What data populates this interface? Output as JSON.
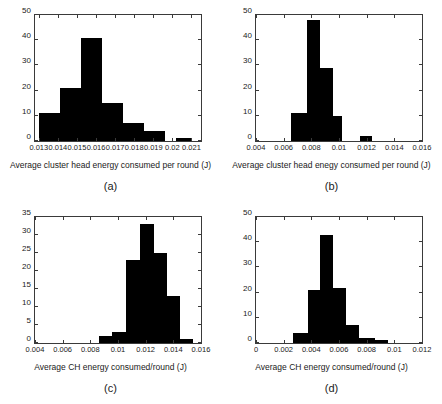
{
  "figure": {
    "background": "#ffffff",
    "bar_color": "#000000",
    "axis_color": "#3a3a3a"
  },
  "panels": [
    {
      "key": "a",
      "caption": "(a)",
      "xlabel": "Average cluster head energy consumed per round (J)",
      "ylabel": ""
    },
    {
      "key": "b",
      "caption": "(b)",
      "xlabel": "Average cluster head enegy consumed per round (J)",
      "ylabel": ""
    },
    {
      "key": "c",
      "caption": "(c)",
      "xlabel": "Average CH energy consumed/round (J)",
      "ylabel": ""
    },
    {
      "key": "d",
      "caption": "(d)",
      "xlabel": "Average CH energy consumed/round (J)",
      "ylabel": ""
    }
  ],
  "chart_data": [
    {
      "type": "bar",
      "panel": "a",
      "title": "",
      "xlabel": "Average cluster head energy consumed per round (J)",
      "ylabel": "",
      "xlim": [
        0.0128,
        0.0215
      ],
      "ylim": [
        0,
        50
      ],
      "xticks": [
        0.013,
        0.014,
        0.015,
        0.016,
        0.017,
        0.018,
        0.019,
        0.02,
        0.021
      ],
      "xtick_labels": [
        "0.013",
        "0.014",
        "0.015",
        "0.016",
        "0.017",
        "0.018",
        "0.019",
        "0.02",
        "0.021"
      ],
      "yticks": [
        0,
        10,
        20,
        30,
        40,
        50
      ],
      "ytick_labels": [
        "0",
        "10",
        "20",
        "30",
        "40",
        "50"
      ],
      "grid": false,
      "legend": null,
      "bins": [
        {
          "left": 0.013,
          "right": 0.0141,
          "value": 11
        },
        {
          "left": 0.0141,
          "right": 0.0152,
          "value": 21
        },
        {
          "left": 0.0152,
          "right": 0.0163,
          "value": 41
        },
        {
          "left": 0.0163,
          "right": 0.0174,
          "value": 15
        },
        {
          "left": 0.0174,
          "right": 0.0185,
          "value": 7
        },
        {
          "left": 0.0185,
          "right": 0.0196,
          "value": 4
        },
        {
          "left": 0.0202,
          "right": 0.021,
          "value": 1
        }
      ]
    },
    {
      "type": "bar",
      "panel": "b",
      "title": "",
      "xlabel": "Average cluster head enegy consumed per round (J)",
      "ylabel": "",
      "xlim": [
        0.004,
        0.016
      ],
      "ylim": [
        0,
        50
      ],
      "xticks": [
        0.004,
        0.006,
        0.008,
        0.01,
        0.012,
        0.014,
        0.016
      ],
      "xtick_labels": [
        "0.004",
        "0.006",
        "0.008",
        "0.01",
        "0.012",
        "0.014",
        "0.016"
      ],
      "yticks": [
        0,
        10,
        20,
        30,
        40,
        50
      ],
      "ytick_labels": [
        "0",
        "10",
        "20",
        "30",
        "40",
        "50"
      ],
      "grid": false,
      "legend": null,
      "bins": [
        {
          "left": 0.00655,
          "right": 0.0077,
          "value": 11
        },
        {
          "left": 0.0077,
          "right": 0.00865,
          "value": 48
        },
        {
          "left": 0.00865,
          "right": 0.00955,
          "value": 29
        },
        {
          "left": 0.00955,
          "right": 0.0102,
          "value": 10
        },
        {
          "left": 0.0115,
          "right": 0.01235,
          "value": 2
        }
      ]
    },
    {
      "type": "bar",
      "panel": "c",
      "title": "",
      "xlabel": "Average CH energy consumed/round (J)",
      "ylabel": "",
      "xlim": [
        0.004,
        0.016
      ],
      "ylim": [
        0,
        35
      ],
      "xticks": [
        0.004,
        0.006,
        0.008,
        0.01,
        0.012,
        0.014,
        0.016
      ],
      "xtick_labels": [
        "0.004",
        "0.006",
        "0.008",
        "0.01",
        "0.012",
        "0.014",
        "0.016"
      ],
      "yticks": [
        0,
        5,
        10,
        15,
        20,
        25,
        30,
        35
      ],
      "ytick_labels": [
        "0",
        "5",
        "10",
        "15",
        "20",
        "25",
        "30",
        "35"
      ],
      "grid": false,
      "legend": null,
      "bins": [
        {
          "left": 0.0086,
          "right": 0.00955,
          "value": 2
        },
        {
          "left": 0.00955,
          "right": 0.0106,
          "value": 3
        },
        {
          "left": 0.0106,
          "right": 0.0116,
          "value": 23
        },
        {
          "left": 0.0116,
          "right": 0.0126,
          "value": 33
        },
        {
          "left": 0.0126,
          "right": 0.01355,
          "value": 25
        },
        {
          "left": 0.01355,
          "right": 0.0145,
          "value": 13
        },
        {
          "left": 0.0145,
          "right": 0.01545,
          "value": 1
        }
      ]
    },
    {
      "type": "bar",
      "panel": "d",
      "title": "",
      "xlabel": "Average CH energy consumed/round (J)",
      "ylabel": "",
      "xlim": [
        0,
        0.012
      ],
      "ylim": [
        0,
        50
      ],
      "xticks": [
        0,
        0.002,
        0.004,
        0.006,
        0.008,
        0.01,
        0.012
      ],
      "xtick_labels": [
        "0",
        "0.002",
        "0.004",
        "0.006",
        "0.008",
        "0.01",
        "0.012"
      ],
      "yticks": [
        0,
        10,
        20,
        30,
        40,
        50
      ],
      "ytick_labels": [
        "0",
        "10",
        "20",
        "30",
        "40",
        "50"
      ],
      "grid": false,
      "legend": null,
      "bins": [
        {
          "left": 0.0027,
          "right": 0.00375,
          "value": 4
        },
        {
          "left": 0.00375,
          "right": 0.0046,
          "value": 21
        },
        {
          "left": 0.0046,
          "right": 0.00555,
          "value": 43
        },
        {
          "left": 0.00555,
          "right": 0.0065,
          "value": 22
        },
        {
          "left": 0.0065,
          "right": 0.00745,
          "value": 7
        },
        {
          "left": 0.00745,
          "right": 0.0086,
          "value": 2
        },
        {
          "left": 0.0086,
          "right": 0.00955,
          "value": 1
        }
      ]
    }
  ]
}
